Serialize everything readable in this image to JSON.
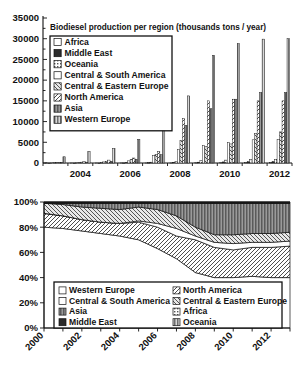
{
  "chart_data": [
    {
      "type": "bar",
      "id": "biodiesel-production-bar",
      "title": "Biodiesel production per region (thousands tons / year)",
      "xlabel": "",
      "ylabel": "",
      "ylim": [
        0,
        35000
      ],
      "ytick_step": 5000,
      "yticks": [
        "0",
        "5000",
        "10000",
        "15000",
        "20000",
        "25000",
        "30000",
        "35000"
      ],
      "grid": false,
      "legend_position": "upper-left",
      "x": [
        2003,
        2004,
        2005,
        2006,
        2007,
        2008,
        2009,
        2010,
        2011,
        2012
      ],
      "xtick_labels": [
        "2004",
        "2006",
        "2008",
        "2010",
        "2012"
      ],
      "xtick_values": [
        2004,
        2006,
        2008,
        2010,
        2012
      ],
      "series": [
        {
          "name": "Africa",
          "pattern": "empty",
          "values": [
            0,
            0,
            0,
            10,
            20,
            40,
            60,
            80,
            90,
            100
          ]
        },
        {
          "name": "Middle East",
          "pattern": "solid",
          "values": [
            0,
            0,
            0,
            20,
            60,
            120,
            200,
            260,
            300,
            340
          ]
        },
        {
          "name": "Oceania",
          "pattern": "fine",
          "values": [
            0,
            30,
            60,
            110,
            200,
            400,
            600,
            700,
            800,
            900
          ]
        },
        {
          "name": "Central & South America",
          "pattern": "empty",
          "values": [
            60,
            130,
            260,
            520,
            1750,
            3300,
            4200,
            5000,
            5600,
            5700
          ]
        },
        {
          "name": "Central & Eastern Europe",
          "pattern": "diag",
          "values": [
            90,
            200,
            420,
            900,
            2100,
            5400,
            3950,
            4600,
            7100,
            7500
          ]
        },
        {
          "name": "North America",
          "pattern": "hatch",
          "values": [
            120,
            330,
            700,
            1200,
            2800,
            10700,
            15000,
            15400,
            15000,
            15000
          ]
        },
        {
          "name": "Asia",
          "pattern": "mid",
          "values": [
            80,
            200,
            400,
            900,
            2000,
            9100,
            13100,
            15400,
            17000,
            17000
          ]
        },
        {
          "name": "Western Europe",
          "pattern": "vert",
          "values": [
            1500,
            2800,
            3500,
            5700,
            9500,
            16200,
            26000,
            28800,
            29900,
            30000
          ]
        }
      ]
    },
    {
      "type": "area",
      "id": "biodiesel-share-stacked-area",
      "title": "",
      "xlabel": "",
      "ylabel": "",
      "ylim": [
        0,
        100
      ],
      "ytick_step": 20,
      "yticks": [
        "0%",
        "20%",
        "40%",
        "60%",
        "80%",
        "100%"
      ],
      "grid": false,
      "stacked": true,
      "normalized_percent": true,
      "legend_position": "inside-bottom",
      "legend_columns": 2,
      "x": [
        2000,
        2001,
        2002,
        2003,
        2004,
        2005,
        2006,
        2007,
        2008,
        2009,
        2010,
        2011,
        2012,
        2013
      ],
      "xtick_labels": [
        "2000",
        "2002",
        "2004",
        "2006",
        "2008",
        "2010",
        "2012"
      ],
      "xtick_values": [
        2000,
        2002,
        2004,
        2006,
        2008,
        2010,
        2012
      ],
      "xtick_rotation": 45,
      "series": [
        {
          "name": "Western Europe",
          "pattern": "empty",
          "values": [
            80,
            79,
            77,
            75,
            73,
            70,
            63,
            55,
            44,
            40,
            40,
            41,
            40,
            40
          ]
        },
        {
          "name": "North America",
          "pattern": "hatch",
          "values": [
            11,
            10,
            9,
            9,
            10,
            14,
            17,
            18,
            26,
            24,
            22,
            23,
            24,
            25
          ]
        },
        {
          "name": "Central & South America",
          "pattern": "empty",
          "values": [
            0,
            0,
            0,
            0,
            0,
            1,
            3,
            6,
            3,
            4,
            5,
            4,
            4,
            4
          ]
        },
        {
          "name": "Central & Eastern Europe",
          "pattern": "diag",
          "values": [
            8,
            9,
            10,
            11,
            11,
            11,
            11,
            10,
            7,
            6,
            7,
            7,
            7,
            7
          ]
        },
        {
          "name": "Asia",
          "pattern": "mid",
          "values": [
            0,
            1,
            3,
            4,
            5,
            3,
            5,
            10,
            19,
            25,
            25,
            24,
            24,
            23
          ]
        },
        {
          "name": "Africa",
          "pattern": "fine",
          "values": [
            0,
            0,
            0,
            0,
            0,
            0,
            0,
            0,
            0,
            0,
            0,
            0,
            0,
            0
          ]
        },
        {
          "name": "Middle East",
          "pattern": "solid",
          "values": [
            1,
            1,
            1,
            1,
            1,
            1,
            1,
            1,
            1,
            1,
            1,
            1,
            1,
            1
          ]
        },
        {
          "name": "Oceania",
          "pattern": "vert",
          "values": [
            0,
            0,
            0,
            0,
            0,
            0,
            0,
            0,
            0,
            0,
            0,
            0,
            0,
            0
          ]
        }
      ],
      "legend_order": [
        "Western Europe",
        "North America",
        "Central & South America",
        "Central & Eastern Europe",
        "Asia",
        "Africa",
        "Middle East",
        "Oceania"
      ]
    }
  ]
}
